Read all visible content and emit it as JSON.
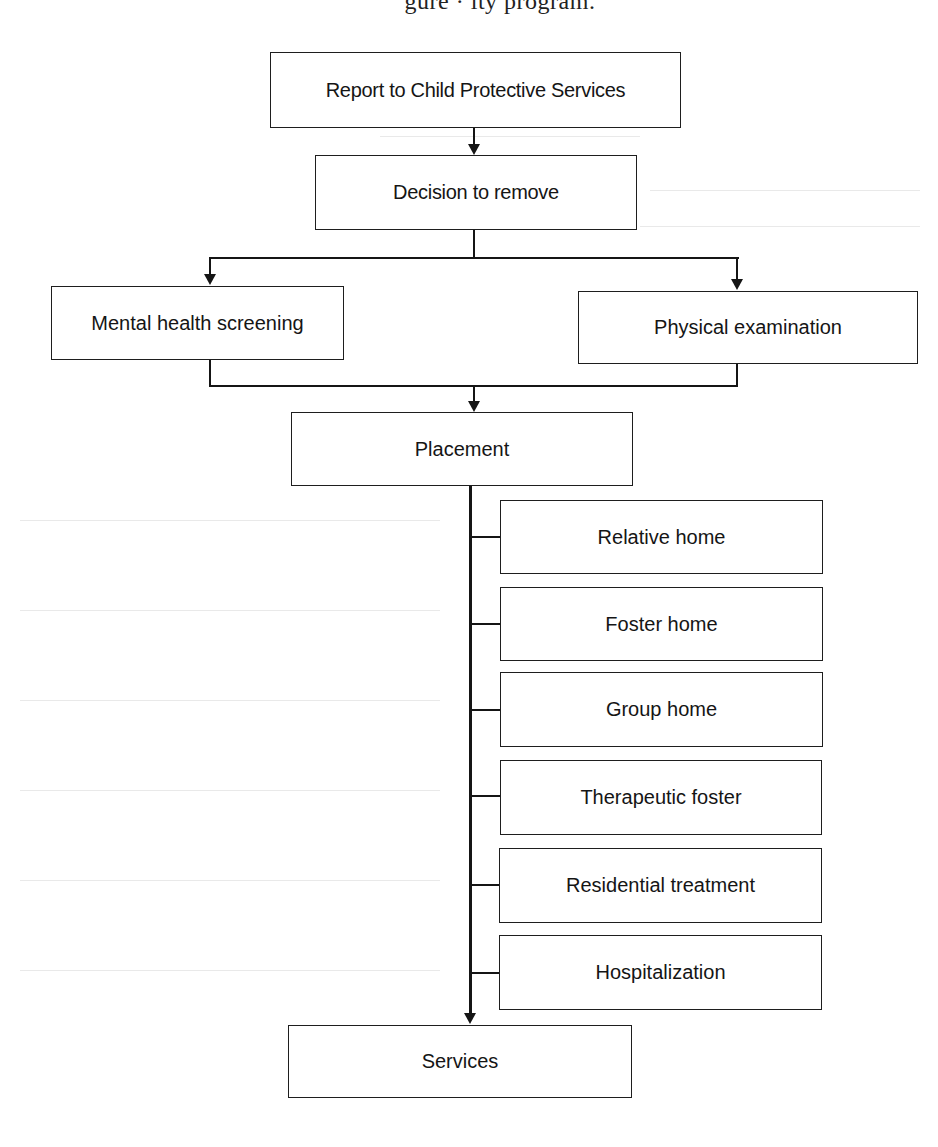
{
  "caption": {
    "text": "gure  ·  ity             program."
  },
  "diagram": {
    "type": "flowchart",
    "nodes": {
      "report": {
        "label": "Report to Child Protective Services"
      },
      "decision": {
        "label": "Decision to remove"
      },
      "mental_health": {
        "label": "Mental health screening"
      },
      "physical_exam": {
        "label": "Physical examination"
      },
      "placement": {
        "label": "Placement"
      },
      "placement_options": [
        {
          "label": "Relative home"
        },
        {
          "label": "Foster home"
        },
        {
          "label": "Group home"
        },
        {
          "label": "Therapeutic foster"
        },
        {
          "label": "Residential treatment"
        },
        {
          "label": "Hospitalization"
        }
      ],
      "services": {
        "label": "Services"
      }
    },
    "edges": [
      [
        "Report to Child Protective Services",
        "Decision to remove"
      ],
      [
        "Decision to remove",
        "Mental health screening"
      ],
      [
        "Decision to remove",
        "Physical examination"
      ],
      [
        "Mental health screening",
        "Placement"
      ],
      [
        "Physical examination",
        "Placement"
      ],
      [
        "Placement",
        "Relative home"
      ],
      [
        "Placement",
        "Foster home"
      ],
      [
        "Placement",
        "Group home"
      ],
      [
        "Placement",
        "Therapeutic foster"
      ],
      [
        "Placement",
        "Residential treatment"
      ],
      [
        "Placement",
        "Hospitalization"
      ],
      [
        "Placement",
        "Services"
      ]
    ]
  }
}
